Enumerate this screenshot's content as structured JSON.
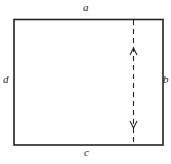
{
  "diagram": {
    "labels": {
      "top": "a",
      "right": "b",
      "bottom": "c",
      "left": "d"
    },
    "colors": {
      "line": "#222222",
      "background": "#ffffff"
    },
    "dashed_line": {
      "direction": "vertical",
      "arrows": [
        "up",
        "down"
      ]
    }
  }
}
